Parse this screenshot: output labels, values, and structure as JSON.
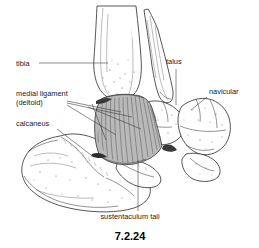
{
  "figure": {
    "number": "7.2.24",
    "background_color": "#ffffff",
    "ink_color": "#1a1a1a",
    "ligament_fill": "#b9b9b9",
    "style": "black-and-white anatomical line drawing with stipple shading"
  },
  "labels": [
    {
      "id": "tibia",
      "text": "tibia",
      "x": 16,
      "y": 66,
      "anchor": "start",
      "leader": "horizontal line running right to the distal tibia shaft"
    },
    {
      "id": "medial-ligament",
      "text": "medial ligament",
      "x": 16,
      "y": 96,
      "anchor": "start",
      "leader": "fan of lines to the deltoid ligament"
    },
    {
      "id": "medial-ligament-2",
      "text": "(deltoid)",
      "x": 16,
      "y": 105,
      "anchor": "start",
      "leader": "continuation of medial ligament label"
    },
    {
      "id": "calcaneus",
      "text": "calcaneus",
      "x": 16,
      "y": 126,
      "anchor": "start",
      "leader": "diagonal line down-right to calcaneus body"
    },
    {
      "id": "talus",
      "text": "talus",
      "x": 166,
      "y": 64,
      "anchor": "start",
      "leader": "vertical line down to talus"
    },
    {
      "id": "navicular",
      "text": "navicular",
      "x": 209,
      "y": 94,
      "anchor": "start",
      "leader": "diagonal line down-left to navicular"
    },
    {
      "id": "sustentaculum-tali",
      "text": "sustentaculum tali",
      "x": 130,
      "y": 219,
      "anchor": "middle",
      "leader": "vertical line up to sustentaculum tali"
    }
  ],
  "anatomy_parts": [
    {
      "id": "tibia-shaft",
      "name": "tibia"
    },
    {
      "id": "medial-malleolus",
      "name": "medial malleolus"
    },
    {
      "id": "fibula",
      "name": "fibula / lateral shaft"
    },
    {
      "id": "talus-body",
      "name": "talus"
    },
    {
      "id": "navicular-bone",
      "name": "navicular"
    },
    {
      "id": "calcaneus-body",
      "name": "calcaneus"
    },
    {
      "id": "sustentaculum",
      "name": "sustentaculum tali"
    },
    {
      "id": "deltoid-ligament",
      "name": "medial (deltoid) ligament"
    }
  ]
}
